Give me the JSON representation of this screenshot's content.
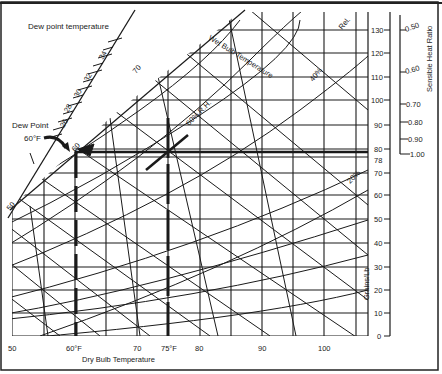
{
  "labels": {
    "dew_point_axis": "Dew point temperature",
    "dew_point_marker": "Dew Point",
    "dew_point_value": "60°F",
    "wet_bulb": "Wet Bulb Temperature",
    "rh60": "60% R.H.",
    "rh40": "40%",
    "rh20": "20%",
    "relative_heat": "Rel.",
    "dry_bulb_axis": "Dry Bulb Temperature",
    "grains_axis": "Grains/Lb",
    "shr_axis": "Sensible Heat Ratio"
  },
  "dew_point_ticks": [
    "26",
    "28",
    "30",
    "32",
    "34"
  ],
  "wet_bulb_ticks": [
    "70",
    "60",
    "50"
  ],
  "dry_bulb_ticks": [
    {
      "label": "50",
      "x": 12
    },
    {
      "label": "60°F",
      "x": 75
    },
    {
      "label": "70",
      "x": 137
    },
    {
      "label": "75°F",
      "x": 168
    },
    {
      "label": "80",
      "x": 200
    },
    {
      "label": "90",
      "x": 262
    },
    {
      "label": "100",
      "x": 324
    }
  ],
  "grains_ticks": [
    {
      "label": "130",
      "y": 30
    },
    {
      "label": "120",
      "y": 53
    },
    {
      "label": "110",
      "y": 77
    },
    {
      "label": "100",
      "y": 100
    },
    {
      "label": "90",
      "y": 125
    },
    {
      "label": "80",
      "y": 149
    },
    {
      "label": "78",
      "y": 160
    },
    {
      "label": "70",
      "y": 173
    },
    {
      "label": "60",
      "y": 195
    },
    {
      "label": "50",
      "y": 219
    },
    {
      "label": "40",
      "y": 243
    },
    {
      "label": "30",
      "y": 267
    },
    {
      "label": "20",
      "y": 290
    },
    {
      "label": "10",
      "y": 313
    },
    {
      "label": "0",
      "y": 336
    }
  ],
  "shr_ticks": [
    {
      "label": "0.50",
      "y": 30
    },
    {
      "label": "0.60",
      "y": 72
    },
    {
      "label": "0.70",
      "y": 104
    },
    {
      "label": "0.80",
      "y": 122
    },
    {
      "label": "0.90",
      "y": 139
    },
    {
      "label": "1.00",
      "y": 154
    }
  ]
}
